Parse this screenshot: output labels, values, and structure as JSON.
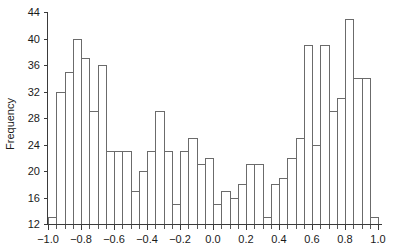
{
  "chart_data": {
    "type": "bar",
    "title": "",
    "subtitle": "",
    "xlabel": "",
    "ylabel": "Frequency",
    "xlim": [
      -1.0,
      1.0
    ],
    "ylim": [
      12,
      44
    ],
    "grid": false,
    "legend": null,
    "bin_width": 0.05,
    "bin_starts": [
      -1.0,
      -0.95,
      -0.9,
      -0.85,
      -0.8,
      -0.75,
      -0.7,
      -0.65,
      -0.6,
      -0.55,
      -0.5,
      -0.45,
      -0.4,
      -0.35,
      -0.3,
      -0.25,
      -0.2,
      -0.15,
      -0.1,
      -0.05,
      0.0,
      0.05,
      0.1,
      0.15,
      0.2,
      0.25,
      0.3,
      0.35,
      0.4,
      0.45,
      0.5,
      0.55,
      0.6,
      0.65,
      0.7,
      0.75,
      0.8,
      0.85,
      0.9,
      0.95
    ],
    "categories": [
      "-1.00",
      "-0.95",
      "-0.90",
      "-0.85",
      "-0.80",
      "-0.75",
      "-0.70",
      "-0.65",
      "-0.60",
      "-0.55",
      "-0.50",
      "-0.45",
      "-0.40",
      "-0.35",
      "-0.30",
      "-0.25",
      "-0.20",
      "-0.15",
      "-0.10",
      "-0.05",
      "0.00",
      "0.05",
      "0.10",
      "0.15",
      "0.20",
      "0.25",
      "0.30",
      "0.35",
      "0.40",
      "0.45",
      "0.50",
      "0.55",
      "0.60",
      "0.65",
      "0.70",
      "0.75",
      "0.80",
      "0.85",
      "0.90",
      "0.95"
    ],
    "values": [
      13,
      32,
      35,
      40,
      37,
      29,
      36,
      23,
      23,
      23,
      17,
      20,
      23,
      29,
      23,
      15,
      23,
      25,
      21,
      22,
      15,
      17,
      16,
      18,
      21,
      21,
      13,
      18,
      19,
      22,
      25,
      39,
      24,
      39,
      29,
      31,
      43,
      34,
      34,
      13
    ],
    "xticks": [
      -1.0,
      -0.8,
      -0.6,
      -0.4,
      -0.2,
      0.0,
      0.2,
      0.4,
      0.6,
      0.8,
      1.0
    ],
    "xticklabels": [
      "−1.0",
      "−0.8",
      "−0.6",
      "−0.4",
      "−0.2",
      "0.0",
      "0.2",
      "0.4",
      "0.6",
      "0.8",
      "1.0"
    ],
    "yticks": [
      12,
      16,
      20,
      24,
      28,
      32,
      36,
      40,
      44
    ],
    "yticklabels": [
      "12",
      "16",
      "20",
      "24",
      "28",
      "32",
      "36",
      "40",
      "44"
    ],
    "colors": {
      "bar_fill": "#ffffff",
      "bar_stroke": "#6b6b6b",
      "axis": "#3a3a3a",
      "text": "#1a1a1a",
      "background": "#ffffff"
    }
  }
}
